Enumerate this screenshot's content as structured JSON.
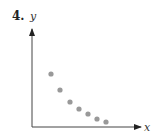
{
  "problem_number": "4.",
  "chart_data": {
    "type": "scatter",
    "title": "",
    "xlabel": "x",
    "ylabel": "y",
    "grid": false,
    "legend": null,
    "axis_ticks": "none",
    "points_pixel": [
      [
        51,
        74
      ],
      [
        60,
        90
      ],
      [
        70,
        102
      ],
      [
        79,
        109
      ],
      [
        88,
        114
      ],
      [
        97,
        119
      ],
      [
        106,
        122
      ]
    ],
    "x": [
      1,
      2,
      3,
      4,
      5,
      6,
      7
    ],
    "y": [
      5.3,
      3.8,
      2.6,
      1.9,
      1.4,
      0.9,
      0.6
    ],
    "trend": "decreasing, convex (exponential-decay-like)",
    "point_color": "#999999"
  }
}
